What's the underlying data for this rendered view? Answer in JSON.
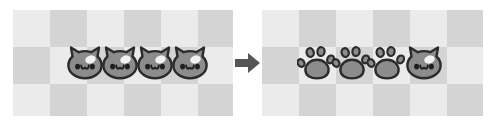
{
  "scene": {
    "type": "before-after-transformation",
    "width": 496,
    "height": 126,
    "background_color": "#ffffff"
  },
  "colors": {
    "checker_light": "#ebebeb",
    "checker_dark": "#d4d4d4",
    "sprite_fill": "#8c8c8c",
    "sprite_fill_light": "#9a9a9a",
    "sprite_outline": "#2b2b2b",
    "sprite_highlight": "#f2f2f2",
    "sprite_eye": "#1f1f1f",
    "arrow_color": "#555555"
  },
  "left_panel": {
    "label": "before-state-board",
    "checker_square_px": 37,
    "items": [
      {
        "kind": "cat-face",
        "index": 1
      },
      {
        "kind": "cat-face",
        "index": 2
      },
      {
        "kind": "cat-face",
        "index": 3
      },
      {
        "kind": "cat-face",
        "index": 4
      }
    ],
    "cat_count": 4,
    "paw_count": 0
  },
  "arrow": {
    "label": "transformation-arrow",
    "direction": "right",
    "glyph": "➜"
  },
  "right_panel": {
    "label": "after-state-board",
    "checker_square_px": 37,
    "items": [
      {
        "kind": "paw-print",
        "index": 1
      },
      {
        "kind": "paw-print",
        "index": 2
      },
      {
        "kind": "paw-print",
        "index": 3
      },
      {
        "kind": "cat-face",
        "index": 4
      }
    ],
    "cat_count": 1,
    "paw_count": 3
  },
  "geometry": {
    "left_panel": {
      "x": 13,
      "y": 10,
      "w": 220,
      "h": 106
    },
    "arrow": {
      "x": 235,
      "y": 52,
      "w": 26,
      "h": 22
    },
    "right_panel": {
      "x": 262,
      "y": 10,
      "w": 221,
      "h": 106
    },
    "left_sprite_xs": [
      52,
      87,
      122,
      157
    ],
    "right_sprite_xs": [
      35,
      70,
      105,
      142
    ],
    "sprite_size": 40
  }
}
